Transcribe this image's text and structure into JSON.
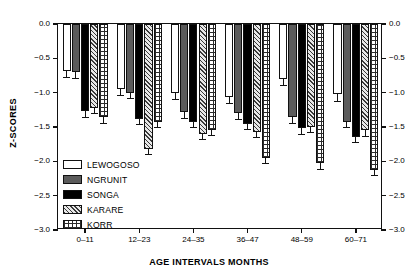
{
  "chart_data": {
    "type": "bar",
    "title": "",
    "xlabel": "AGE INTERVALS MONTHS",
    "ylabel": "Z-SCORES",
    "categories": [
      "0–11",
      "12–23",
      "24–35",
      "36–47",
      "48–59",
      "60–71"
    ],
    "ylim": [
      -3.0,
      0.0
    ],
    "yticks": [
      "0.0",
      "-0.5",
      "-1.0",
      "-1.5",
      "-2.0",
      "-2.5",
      "-3.0"
    ],
    "ytick_values": [
      0.0,
      -0.5,
      -1.0,
      -1.5,
      -2.0,
      -2.5,
      -3.0
    ],
    "right_axis": true,
    "right_yticks": [
      "0.0",
      "-0.5",
      "-1.0",
      "-1.5",
      "-2.0",
      "-2.5",
      "-3.0"
    ],
    "grid": false,
    "legend_position": "inside-lower-left",
    "error_bars": true,
    "series": [
      {
        "name": "LEWOGOSO",
        "fill": "white",
        "values": [
          -0.68,
          -0.95,
          -1.0,
          -1.07,
          -0.8,
          -1.02
        ],
        "errors": [
          0.11,
          0.1,
          0.1,
          0.1,
          0.1,
          0.11
        ]
      },
      {
        "name": "NGRUNIT",
        "fill": "dark-gray",
        "values": [
          -0.7,
          -1.0,
          -1.28,
          -1.3,
          -1.35,
          -1.43
        ],
        "errors": [
          0.1,
          0.09,
          0.1,
          0.1,
          0.1,
          0.09
        ]
      },
      {
        "name": "SONGA",
        "fill": "black",
        "values": [
          -1.27,
          -1.38,
          -1.42,
          -1.46,
          -1.52,
          -1.64
        ],
        "errors": [
          0.1,
          0.09,
          0.09,
          0.09,
          0.09,
          0.09
        ]
      },
      {
        "name": "KARARE",
        "fill": "diagonal-hatch",
        "values": [
          -1.23,
          -1.82,
          -1.6,
          -1.57,
          -1.5,
          -1.55
        ],
        "errors": [
          0.08,
          0.09,
          0.09,
          0.09,
          0.09,
          0.09
        ]
      },
      {
        "name": "KORR",
        "fill": "grid-hatch",
        "values": [
          -1.35,
          -1.42,
          -1.54,
          -1.95,
          -2.03,
          -2.12
        ],
        "errors": [
          0.1,
          0.09,
          0.09,
          0.09,
          0.09,
          0.09
        ]
      }
    ]
  }
}
